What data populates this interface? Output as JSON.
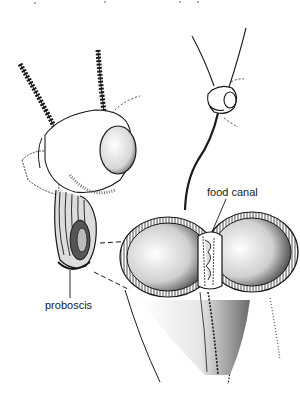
{
  "diagram": {
    "labels": {
      "food_canal": "food canal",
      "proboscis": "proboscis"
    },
    "colors": {
      "ink": "#1a1a1a",
      "background": "#ffffff",
      "shade": "#555555"
    }
  }
}
